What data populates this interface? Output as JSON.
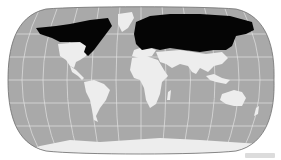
{
  "map": {
    "projection": "Robinson-like world map",
    "colors": {
      "ocean": "#a9a9a9",
      "land": "#ededed",
      "highlight": "#050505",
      "graticule": "#e6e6e6",
      "outline": "#707070"
    },
    "highlighted_region": "Northern land areas (Canada, Alaska, Scandinavia, Russia/Siberia) shown in black"
  }
}
